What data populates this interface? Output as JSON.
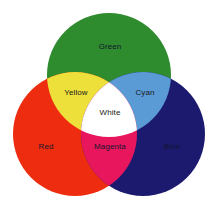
{
  "diagram": {
    "type": "venn-3-circle",
    "background_color": "#FFFFFF",
    "canvas": {
      "width": 218,
      "height": 214
    },
    "circles": [
      {
        "id": "green",
        "label": "Green",
        "color": "#2E8B2E",
        "cx": 109,
        "cy": 75,
        "r": 62
      },
      {
        "id": "red",
        "label": "Red",
        "color": "#EE2D10",
        "cx": 75,
        "cy": 134,
        "r": 62
      },
      {
        "id": "blue",
        "label": "Blue",
        "color": "#1B1A6E",
        "cx": 143,
        "cy": 134,
        "r": 62
      }
    ],
    "intersections": [
      {
        "id": "yellow",
        "label": "Yellow",
        "color": "#EDE03A",
        "sources": [
          "red",
          "green"
        ]
      },
      {
        "id": "cyan",
        "label": "Cyan",
        "color": "#5B9BD5",
        "sources": [
          "green",
          "blue"
        ]
      },
      {
        "id": "magenta",
        "label": "Magenta",
        "color": "#E8175D",
        "sources": [
          "red",
          "blue"
        ]
      },
      {
        "id": "white",
        "label": "White",
        "color": "#FFFFFF",
        "sources": [
          "red",
          "green",
          "blue"
        ]
      }
    ],
    "labels": [
      {
        "id": "green",
        "text": "Green",
        "x": 110,
        "y": 47,
        "dark_bg": true
      },
      {
        "id": "yellow",
        "text": "Yellow",
        "x": 76,
        "y": 93,
        "dark_bg": false
      },
      {
        "id": "cyan",
        "text": "Cyan",
        "x": 145,
        "y": 93,
        "dark_bg": false
      },
      {
        "id": "white",
        "text": "White",
        "x": 110,
        "y": 113,
        "dark_bg": false
      },
      {
        "id": "red",
        "text": "Red",
        "x": 46,
        "y": 147,
        "dark_bg": true
      },
      {
        "id": "magenta",
        "text": "Magenta",
        "x": 110,
        "y": 147,
        "dark_bg": true
      },
      {
        "id": "blue",
        "text": "Blue",
        "x": 172,
        "y": 147,
        "dark_bg": true
      }
    ]
  }
}
